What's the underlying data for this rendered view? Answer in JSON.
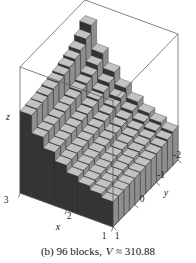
{
  "figure": {
    "caption": {
      "prefix": "(b) 96 blocks,",
      "variable": "V",
      "suffix": "≈ 310.88"
    }
  },
  "chart_data": {
    "type": "bar",
    "subtype": "3d-riemann-blocks",
    "caption": "(b) 96 blocks, V ≈ 310.88",
    "n_blocks": 96,
    "volume_estimate": 310.88,
    "axis_labels": {
      "x": "x",
      "y": "y",
      "z": "z"
    },
    "x_tick_labels": [
      "3",
      "2",
      "1"
    ],
    "y_tick_labels": [
      "1",
      "0",
      "-1",
      "-2"
    ],
    "x_range": [
      1,
      3
    ],
    "y_range": [
      -2,
      1
    ],
    "nx": 8,
    "ny": 12,
    "x_midpoints": [
      1.125,
      1.375,
      1.625,
      1.875,
      2.125,
      2.375,
      2.625,
      2.875
    ],
    "y_midpoints": [
      -1.875,
      -1.625,
      -1.375,
      -1.125,
      -0.875,
      -0.625,
      -0.375,
      -0.125,
      0.125,
      0.375,
      0.625,
      0.875
    ],
    "heights_relative": [
      [
        0.27,
        0.308,
        0.348,
        0.405,
        0.479,
        0.574,
        0.689,
        0.878
      ],
      [
        0.25,
        0.285,
        0.323,
        0.375,
        0.444,
        0.531,
        0.638,
        0.813
      ],
      [
        0.236,
        0.269,
        0.304,
        0.354,
        0.419,
        0.502,
        0.602,
        0.767
      ],
      [
        0.228,
        0.26,
        0.294,
        0.342,
        0.405,
        0.485,
        0.581,
        0.741
      ],
      [
        0.222,
        0.253,
        0.286,
        0.333,
        0.394,
        0.472,
        0.566,
        0.722
      ],
      [
        0.217,
        0.247,
        0.28,
        0.326,
        0.385,
        0.461,
        0.553,
        0.705
      ],
      [
        0.213,
        0.243,
        0.275,
        0.32,
        0.378,
        0.453,
        0.543,
        0.692
      ],
      [
        0.21,
        0.239,
        0.271,
        0.315,
        0.373,
        0.446,
        0.536,
        0.683
      ],
      [
        0.207,
        0.236,
        0.267,
        0.311,
        0.367,
        0.44,
        0.528,
        0.673
      ],
      [
        0.204,
        0.233,
        0.264,
        0.307,
        0.363,
        0.434,
        0.521,
        0.664
      ],
      [
        0.202,
        0.23,
        0.261,
        0.303,
        0.359,
        0.429,
        0.515,
        0.657
      ],
      [
        0.2,
        0.228,
        0.258,
        0.3,
        0.355,
        0.425,
        0.51,
        0.65
      ]
    ],
    "colors": {
      "top_face": "#c2c2c2",
      "front_face": "#343434",
      "side_face": "#8e8e8e",
      "edge": "#262626",
      "frame": "#4d4d4d",
      "background": "#ffffff"
    }
  }
}
